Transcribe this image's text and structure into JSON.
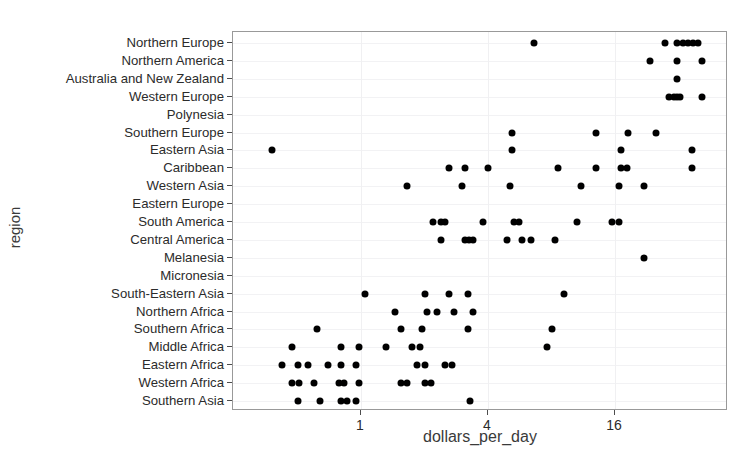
{
  "chart_data": {
    "type": "scatter",
    "title": "",
    "xlabel": "dollars_per_day",
    "ylabel": "region",
    "x_scale": "log2",
    "x_ticks": [
      1,
      4,
      16
    ],
    "x_tick_labels": [
      "1",
      "4",
      "16"
    ],
    "xlim": [
      0.32,
      48
    ],
    "grid": true,
    "legend": "none",
    "point_color": "#000000",
    "panel_background": "#ffffff",
    "gridline_color": "#f2f2f4",
    "categories": [
      "Northern Europe",
      "Northern America",
      "Australia and New Zealand",
      "Western Europe",
      "Polynesia",
      "Southern Europe",
      "Eastern Asia",
      "Caribbean",
      "Western Asia",
      "Eastern Europe",
      "South America",
      "Central America",
      "Melanesia",
      "Micronesia",
      "South-Eastern Asia",
      "Northern Africa",
      "Southern Africa",
      "Middle Africa",
      "Eastern Africa",
      "Western Africa",
      "Southern Asia"
    ],
    "points": [
      {
        "region": "Northern Europe",
        "dollars_per_day": 6.6
      },
      {
        "region": "Northern Europe",
        "dollars_per_day": 27.5
      },
      {
        "region": "Northern Europe",
        "dollars_per_day": 31.5
      },
      {
        "region": "Northern Europe",
        "dollars_per_day": 33.5
      },
      {
        "region": "Northern Europe",
        "dollars_per_day": 35.5
      },
      {
        "region": "Northern Europe",
        "dollars_per_day": 37.5
      },
      {
        "region": "Northern Europe",
        "dollars_per_day": 39.5
      },
      {
        "region": "Northern America",
        "dollars_per_day": 23.5
      },
      {
        "region": "Northern America",
        "dollars_per_day": 31.5
      },
      {
        "region": "Northern America",
        "dollars_per_day": 41.5
      },
      {
        "region": "Australia and New Zealand",
        "dollars_per_day": 31.5
      },
      {
        "region": "Western Europe",
        "dollars_per_day": 29.0
      },
      {
        "region": "Western Europe",
        "dollars_per_day": 30.5
      },
      {
        "region": "Western Europe",
        "dollars_per_day": 31.5
      },
      {
        "region": "Western Europe",
        "dollars_per_day": 32.5
      },
      {
        "region": "Western Europe",
        "dollars_per_day": 41.5
      },
      {
        "region": "Southern Europe",
        "dollars_per_day": 5.2
      },
      {
        "region": "Southern Europe",
        "dollars_per_day": 13.0
      },
      {
        "region": "Southern Europe",
        "dollars_per_day": 18.5
      },
      {
        "region": "Southern Europe",
        "dollars_per_day": 25.0
      },
      {
        "region": "Eastern Asia",
        "dollars_per_day": 0.38
      },
      {
        "region": "Eastern Asia",
        "dollars_per_day": 5.2
      },
      {
        "region": "Eastern Asia",
        "dollars_per_day": 17.0
      },
      {
        "region": "Eastern Asia",
        "dollars_per_day": 37.0
      },
      {
        "region": "Caribbean",
        "dollars_per_day": 2.6
      },
      {
        "region": "Caribbean",
        "dollars_per_day": 3.1
      },
      {
        "region": "Caribbean",
        "dollars_per_day": 4.0
      },
      {
        "region": "Caribbean",
        "dollars_per_day": 8.6
      },
      {
        "region": "Caribbean",
        "dollars_per_day": 13.0
      },
      {
        "region": "Caribbean",
        "dollars_per_day": 17.0
      },
      {
        "region": "Caribbean",
        "dollars_per_day": 18.2
      },
      {
        "region": "Caribbean",
        "dollars_per_day": 37.0
      },
      {
        "region": "Western Asia",
        "dollars_per_day": 1.65
      },
      {
        "region": "Western Asia",
        "dollars_per_day": 3.0
      },
      {
        "region": "Western Asia",
        "dollars_per_day": 5.1
      },
      {
        "region": "Western Asia",
        "dollars_per_day": 11.0
      },
      {
        "region": "Western Asia",
        "dollars_per_day": 16.8
      },
      {
        "region": "Western Asia",
        "dollars_per_day": 22.0
      },
      {
        "region": "South America",
        "dollars_per_day": 2.2
      },
      {
        "region": "South America",
        "dollars_per_day": 2.4
      },
      {
        "region": "South America",
        "dollars_per_day": 2.5
      },
      {
        "region": "South America",
        "dollars_per_day": 3.8
      },
      {
        "region": "South America",
        "dollars_per_day": 5.3
      },
      {
        "region": "South America",
        "dollars_per_day": 5.6
      },
      {
        "region": "South America",
        "dollars_per_day": 10.6
      },
      {
        "region": "South America",
        "dollars_per_day": 15.5
      },
      {
        "region": "South America",
        "dollars_per_day": 16.8
      },
      {
        "region": "Central America",
        "dollars_per_day": 2.4
      },
      {
        "region": "Central America",
        "dollars_per_day": 3.1
      },
      {
        "region": "Central America",
        "dollars_per_day": 3.25
      },
      {
        "region": "Central America",
        "dollars_per_day": 3.4
      },
      {
        "region": "Central America",
        "dollars_per_day": 4.9
      },
      {
        "region": "Central America",
        "dollars_per_day": 5.8
      },
      {
        "region": "Central America",
        "dollars_per_day": 6.4
      },
      {
        "region": "Central America",
        "dollars_per_day": 8.3
      },
      {
        "region": "Melanesia",
        "dollars_per_day": 22.0
      },
      {
        "region": "South-Eastern Asia",
        "dollars_per_day": 1.05
      },
      {
        "region": "South-Eastern Asia",
        "dollars_per_day": 2.0
      },
      {
        "region": "South-Eastern Asia",
        "dollars_per_day": 2.6
      },
      {
        "region": "South-Eastern Asia",
        "dollars_per_day": 3.2
      },
      {
        "region": "South-Eastern Asia",
        "dollars_per_day": 9.2
      },
      {
        "region": "Northern Africa",
        "dollars_per_day": 1.45
      },
      {
        "region": "Northern Africa",
        "dollars_per_day": 2.05
      },
      {
        "region": "Northern Africa",
        "dollars_per_day": 2.3
      },
      {
        "region": "Northern Africa",
        "dollars_per_day": 2.75
      },
      {
        "region": "Northern Africa",
        "dollars_per_day": 3.4
      },
      {
        "region": "Southern Africa",
        "dollars_per_day": 0.62
      },
      {
        "region": "Southern Africa",
        "dollars_per_day": 1.55
      },
      {
        "region": "Southern Africa",
        "dollars_per_day": 1.95
      },
      {
        "region": "Southern Africa",
        "dollars_per_day": 3.2
      },
      {
        "region": "Southern Africa",
        "dollars_per_day": 8.0
      },
      {
        "region": "Middle Africa",
        "dollars_per_day": 0.47
      },
      {
        "region": "Middle Africa",
        "dollars_per_day": 0.8
      },
      {
        "region": "Middle Africa",
        "dollars_per_day": 0.98
      },
      {
        "region": "Middle Africa",
        "dollars_per_day": 1.32
      },
      {
        "region": "Middle Africa",
        "dollars_per_day": 1.75
      },
      {
        "region": "Middle Africa",
        "dollars_per_day": 1.9
      },
      {
        "region": "Middle Africa",
        "dollars_per_day": 7.6
      },
      {
        "region": "Eastern Africa",
        "dollars_per_day": 0.42
      },
      {
        "region": "Eastern Africa",
        "dollars_per_day": 0.5
      },
      {
        "region": "Eastern Africa",
        "dollars_per_day": 0.56
      },
      {
        "region": "Eastern Africa",
        "dollars_per_day": 0.7
      },
      {
        "region": "Eastern Africa",
        "dollars_per_day": 0.8
      },
      {
        "region": "Eastern Africa",
        "dollars_per_day": 0.95
      },
      {
        "region": "Eastern Africa",
        "dollars_per_day": 1.85
      },
      {
        "region": "Eastern Africa",
        "dollars_per_day": 2.0
      },
      {
        "region": "Eastern Africa",
        "dollars_per_day": 2.5
      },
      {
        "region": "Eastern Africa",
        "dollars_per_day": 2.7
      },
      {
        "region": "Western Africa",
        "dollars_per_day": 0.47
      },
      {
        "region": "Western Africa",
        "dollars_per_day": 0.51
      },
      {
        "region": "Western Africa",
        "dollars_per_day": 0.6
      },
      {
        "region": "Western Africa",
        "dollars_per_day": 0.79
      },
      {
        "region": "Western Africa",
        "dollars_per_day": 0.83
      },
      {
        "region": "Western Africa",
        "dollars_per_day": 0.98
      },
      {
        "region": "Western Africa",
        "dollars_per_day": 1.55
      },
      {
        "region": "Western Africa",
        "dollars_per_day": 1.65
      },
      {
        "region": "Western Africa",
        "dollars_per_day": 2.0
      },
      {
        "region": "Western Africa",
        "dollars_per_day": 2.15
      },
      {
        "region": "Southern Asia",
        "dollars_per_day": 0.5
      },
      {
        "region": "Southern Asia",
        "dollars_per_day": 0.64
      },
      {
        "region": "Southern Asia",
        "dollars_per_day": 0.8
      },
      {
        "region": "Southern Asia",
        "dollars_per_day": 0.86
      },
      {
        "region": "Southern Asia",
        "dollars_per_day": 0.95
      },
      {
        "region": "Southern Asia",
        "dollars_per_day": 3.3
      }
    ]
  }
}
